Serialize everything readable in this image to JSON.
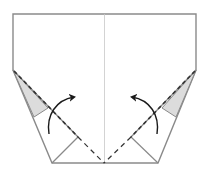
{
  "diagram": {
    "colors": {
      "background": "#ffffff",
      "edge": "#8a8a8a",
      "crease": "#c8c8c8",
      "dash": "#333333",
      "shade": "#dcdcdc",
      "arrow": "#1a1a1a"
    },
    "elements": {
      "outline": "paper-outline",
      "center_crease": "center-crease",
      "left_flap": "left-flap",
      "right_flap": "right-flap",
      "left_shaded": "left-shaded-triangle",
      "right_shaded": "right-shaded-triangle",
      "left_valley": "left-valley-fold-line",
      "right_valley": "right-valley-fold-line",
      "left_arrow": "left-fold-arrow",
      "right_arrow": "right-fold-arrow"
    }
  }
}
